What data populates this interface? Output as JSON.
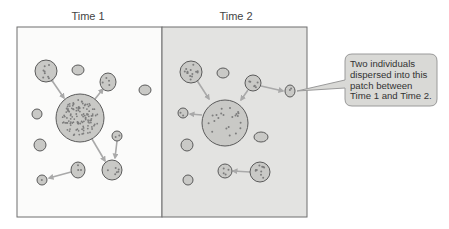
{
  "panels": [
    {
      "title": "Time 1",
      "background": "#fbfbfa"
    },
    {
      "title": "Time 2",
      "background": "#e3e3e1"
    }
  ],
  "callout": {
    "lines": [
      "Two individuals",
      "dispersed into this",
      "patch between",
      "Time 1 and Time 2."
    ]
  },
  "colors": {
    "patch_fill": "#c9c9c6",
    "patch_stroke": "#5a5a5a",
    "dot": "#7d7d7d",
    "arrow": "#a9a9a9",
    "frame": "#6f6f6f",
    "callout_fill": "#d9d9d6",
    "callout_stroke": "#9a9a9a"
  },
  "time1": {
    "patches": [
      {
        "id": "central",
        "cx": 80,
        "cy": 118,
        "rx": 24,
        "ry": 24,
        "dots": 120
      },
      {
        "id": "top-left",
        "cx": 46,
        "cy": 71,
        "rx": 11,
        "ry": 11,
        "dots": 8
      },
      {
        "id": "top-small",
        "cx": 78,
        "cy": 70,
        "rx": 6,
        "ry": 5,
        "dots": 0
      },
      {
        "id": "top-right",
        "cx": 108,
        "cy": 82,
        "rx": 8,
        "ry": 9,
        "dots": 4
      },
      {
        "id": "far-right",
        "cx": 145,
        "cy": 90,
        "rx": 6,
        "ry": 5,
        "dots": 0
      },
      {
        "id": "left",
        "cx": 37,
        "cy": 114,
        "rx": 5,
        "ry": 5,
        "dots": 0
      },
      {
        "id": "left-lower",
        "cx": 40,
        "cy": 145,
        "rx": 6,
        "ry": 6,
        "dots": 0
      },
      {
        "id": "right-small",
        "cx": 117,
        "cy": 136,
        "rx": 5,
        "ry": 5,
        "dots": 2
      },
      {
        "id": "bottom-right",
        "cx": 112,
        "cy": 170,
        "rx": 10,
        "ry": 10,
        "dots": 6
      },
      {
        "id": "bottom-mid",
        "cx": 78,
        "cy": 170,
        "rx": 7,
        "ry": 8,
        "dots": 3
      },
      {
        "id": "bottom-left",
        "cx": 42,
        "cy": 180,
        "rx": 5,
        "ry": 5,
        "dots": 1
      }
    ]
  },
  "time2": {
    "patches": [
      {
        "id": "central",
        "cx": 225,
        "cy": 123,
        "rx": 23,
        "ry": 23,
        "dots": 22
      },
      {
        "id": "top-left",
        "cx": 191,
        "cy": 72,
        "rx": 11,
        "ry": 11,
        "dots": 14
      },
      {
        "id": "top-small",
        "cx": 223,
        "cy": 73,
        "rx": 6,
        "ry": 5,
        "dots": 0
      },
      {
        "id": "top-right",
        "cx": 253,
        "cy": 83,
        "rx": 8,
        "ry": 8,
        "dots": 6
      },
      {
        "id": "dispersal-target",
        "cx": 290,
        "cy": 91,
        "rx": 5,
        "ry": 6,
        "dots": 2
      },
      {
        "id": "left",
        "cx": 183,
        "cy": 113,
        "rx": 5,
        "ry": 5,
        "dots": 2
      },
      {
        "id": "right-mid",
        "cx": 261,
        "cy": 137,
        "rx": 7,
        "ry": 5,
        "dots": 0
      },
      {
        "id": "left-lower",
        "cx": 187,
        "cy": 145,
        "rx": 6,
        "ry": 6,
        "dots": 0
      },
      {
        "id": "bottom-right",
        "cx": 260,
        "cy": 172,
        "rx": 10,
        "ry": 10,
        "dots": 10
      },
      {
        "id": "bottom-mid",
        "cx": 225,
        "cy": 171,
        "rx": 7,
        "ry": 7,
        "dots": 4
      },
      {
        "id": "bottom-left",
        "cx": 188,
        "cy": 180,
        "rx": 5,
        "ry": 5,
        "dots": 0
      }
    ]
  }
}
